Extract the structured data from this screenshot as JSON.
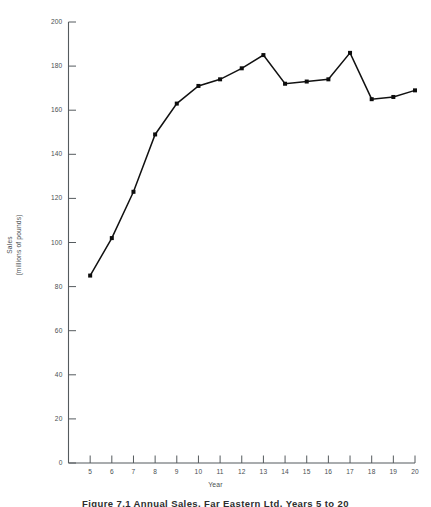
{
  "figure": {
    "caption": "Figure 7.1  Annual Sales, Far Eastern Ltd, Years 5 to 20"
  },
  "chart_data": {
    "type": "line",
    "title": "",
    "subtitle": "",
    "xlabel": "Year",
    "ylabel_line1": "Sales",
    "ylabel_line2": "(millions of pounds)",
    "ylabel": "Sales (millions of pounds)",
    "xlim": [
      4,
      20
    ],
    "ylim": [
      0,
      200
    ],
    "x_tick_labels": [
      "5",
      "6",
      "7",
      "8",
      "9",
      "10",
      "11",
      "12",
      "13",
      "14",
      "15",
      "16",
      "17",
      "18",
      "19",
      "20"
    ],
    "y_tick_labels": [
      "0",
      "20",
      "40",
      "60",
      "80",
      "100",
      "120",
      "140",
      "160",
      "180",
      "200"
    ],
    "y_ticks": [
      0,
      20,
      40,
      60,
      80,
      100,
      120,
      140,
      160,
      180,
      200
    ],
    "grid": false,
    "legend": false,
    "legend_position": "none",
    "marker": "square",
    "line_color": "#111111",
    "marker_color": "#0d0d0d",
    "axis_color": "#555b5e",
    "background": "#ffffff",
    "x": [
      5,
      6,
      7,
      8,
      9,
      10,
      11,
      12,
      13,
      14,
      15,
      16,
      17,
      18,
      19,
      20
    ],
    "categories": [
      "5",
      "6",
      "7",
      "8",
      "9",
      "10",
      "11",
      "12",
      "13",
      "14",
      "15",
      "16",
      "17",
      "18",
      "19",
      "20"
    ],
    "values": [
      85,
      102,
      123,
      149,
      163,
      171,
      174,
      179,
      185,
      172,
      173,
      174,
      186,
      165,
      166,
      169
    ],
    "series": [
      {
        "name": "Sales",
        "values": [
          85,
          102,
          123,
          149,
          163,
          171,
          174,
          179,
          185,
          172,
          173,
          174,
          186,
          165,
          166,
          169
        ]
      }
    ]
  }
}
